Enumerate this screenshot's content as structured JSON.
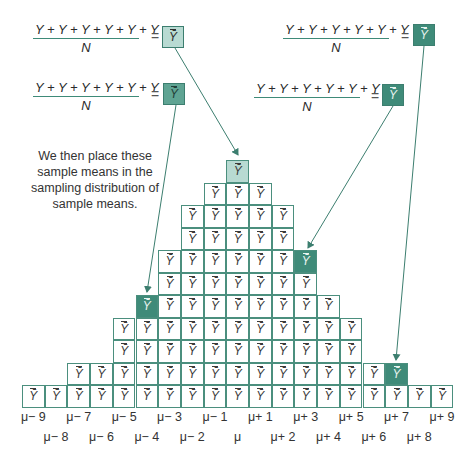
{
  "formulas": [
    {
      "id": "top-left",
      "numerator": "Y + Y + Y + Y + Y + Y",
      "denominator": "N",
      "equals": "=",
      "result": "Ȳ",
      "shade": "light"
    },
    {
      "id": "mid-left",
      "numerator": "Y + Y + Y + Y + Y + Y",
      "denominator": "N",
      "equals": "=",
      "result": "Ȳ",
      "shade": "mid"
    },
    {
      "id": "top-right",
      "numerator": "Y + Y + Y + Y + Y + Y",
      "denominator": "N",
      "equals": "=",
      "result": "Ȳ",
      "shade": "dark"
    },
    {
      "id": "mid-right",
      "numerator": "Y + Y + Y + Y + Y + Y",
      "denominator": "N",
      "equals": "=",
      "result": "Ȳ",
      "shade": "dark"
    }
  ],
  "caption": "We then place these sample means in the sampling distribution of sample means.",
  "cell_symbol": "Ȳ",
  "colors": {
    "grid": "#4b8f7e",
    "light": "#b8dad2",
    "mid": "#5fa493",
    "dark": "#3f8b79",
    "arrow": "#3c7e6f"
  },
  "pyramid": {
    "columns": 19,
    "rows_bottom_to_top": [
      {
        "from": -9,
        "to": 9
      },
      {
        "from": -7,
        "to": 6,
        "highlight": {
          "offset": 7,
          "shade": "dark"
        }
      },
      {
        "from": -5,
        "to": 5
      },
      {
        "from": -5,
        "to": 5
      },
      {
        "from": -4,
        "to": 4,
        "highlight": {
          "offset": -4,
          "shade": "mid"
        }
      },
      {
        "from": -3,
        "to": 3
      },
      {
        "from": -3,
        "to": 2,
        "highlight": {
          "offset": 3,
          "shade": "dark"
        }
      },
      {
        "from": -2,
        "to": 2
      },
      {
        "from": -2,
        "to": 2
      },
      {
        "from": -1,
        "to": 1
      },
      {
        "from": 0,
        "to": -1,
        "highlight": {
          "offset": 0,
          "shade": "light"
        }
      }
    ]
  },
  "axis_labels_row1": [
    "μ− 9",
    "μ− 7",
    "μ− 5",
    "μ− 3",
    "μ− 1",
    "μ+ 1",
    "μ+ 3",
    "μ+ 5",
    "μ+ 7",
    "μ+ 9"
  ],
  "axis_labels_row2": [
    "μ− 8",
    "μ− 6",
    "μ− 4",
    "μ− 2",
    "μ",
    "μ+ 2",
    "μ+ 4",
    "μ+ 6",
    "μ+ 8"
  ]
}
